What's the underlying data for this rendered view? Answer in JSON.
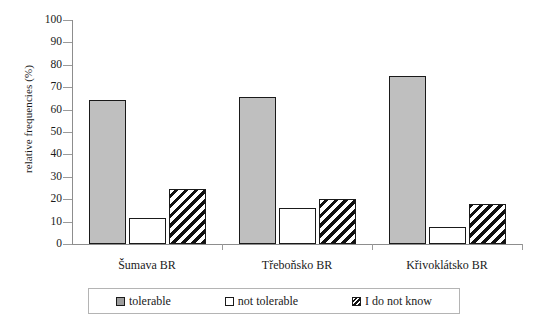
{
  "chart_data": {
    "type": "bar",
    "title": "",
    "xlabel": "",
    "ylabel": "relative frequencies (%)",
    "ylim": [
      0,
      100
    ],
    "ytick_step": 10,
    "yticks": [
      0,
      10,
      20,
      30,
      40,
      50,
      60,
      70,
      80,
      90,
      100
    ],
    "ytick_labels": [
      "0",
      "10",
      "20",
      "30",
      "40",
      "50",
      "60",
      "70",
      "80",
      "90",
      "100"
    ],
    "grid": false,
    "legend_position": "bottom",
    "categories": [
      "Šumava BR",
      "Třeboňsko BR",
      "Křivoklátsko BR"
    ],
    "series": [
      {
        "name": "tolerable",
        "values": [
          64.5,
          65.5,
          75.0
        ],
        "color": "#bfbfbf",
        "pattern": "solid"
      },
      {
        "name": "not tolerable",
        "values": [
          11.5,
          16.0,
          7.5
        ],
        "color": "#ffffff",
        "pattern": "none"
      },
      {
        "name": "I do not know",
        "values": [
          24.5,
          20.0,
          18.0
        ],
        "color": "#111111",
        "pattern": "diagonal-hatch"
      }
    ]
  },
  "legend": {
    "items": [
      {
        "label": "tolerable",
        "swatch": "legend-swatch-tolerable"
      },
      {
        "label": "not tolerable",
        "swatch": "legend-swatch-not-tolerable"
      },
      {
        "label": "I do not know",
        "swatch": "legend-swatch-dont-know"
      }
    ]
  }
}
